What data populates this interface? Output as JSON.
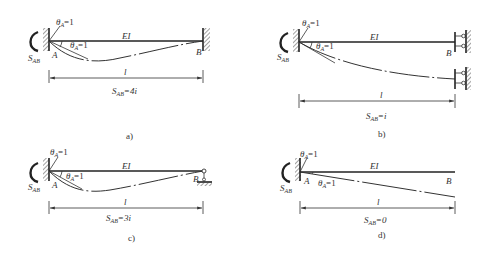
{
  "panels": [
    {
      "id": "a",
      "caption": "a)",
      "rotation_label": "θA=1",
      "angle_label": "θA=1",
      "moment_label": "SAB",
      "node_a": "A",
      "node_b": "B",
      "stiffness": "EI",
      "length": "l",
      "result": "SAB=4i",
      "far_end_support": "fixed"
    },
    {
      "id": "b",
      "caption": "b)",
      "rotation_label": "θA=1",
      "angle_label": "θA=1",
      "moment_label": "SAB",
      "node_a": "A",
      "node_b": "B",
      "stiffness": "EI",
      "length": "l",
      "result": "SAB=i",
      "far_end_support": "guided (sliding)"
    },
    {
      "id": "c",
      "caption": "c)",
      "rotation_label": "θA=1",
      "angle_label": "θA=1",
      "moment_label": "SAB",
      "node_a": "A",
      "node_b": "B",
      "stiffness": "EI",
      "length": "l",
      "result": "SAB=3i",
      "far_end_support": "pinned"
    },
    {
      "id": "d",
      "caption": "d)",
      "rotation_label": "θA=1",
      "angle_label": "θA=1",
      "moment_label": "SAB",
      "node_a": "A",
      "node_b": "B",
      "stiffness": "EI",
      "length": "l",
      "result": "SAB=0",
      "far_end_support": "free"
    }
  ],
  "text": {
    "theta": "θ",
    "sub_a": "A",
    "eq1": "=1",
    "S": "S",
    "sub_ab": "AB",
    "eq_4i": "=4i",
    "eq_i": "=i",
    "eq_3i": "=3i",
    "eq_0": "=0"
  }
}
